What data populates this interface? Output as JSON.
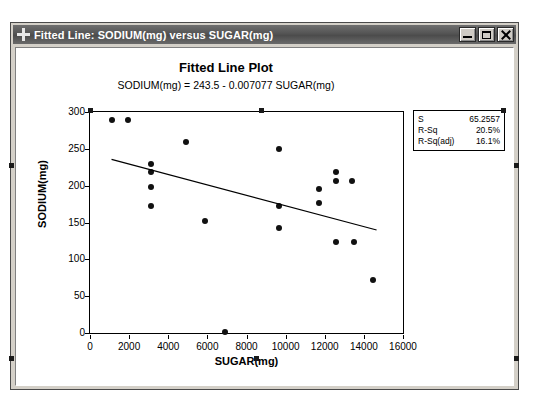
{
  "window": {
    "title": "Fitted Line: SODIUM(mg) versus SUGAR(mg)",
    "icon": "crosshair-icon",
    "buttons": {
      "minimize": "Minimize",
      "maximize": "Maximize",
      "close": "Close"
    }
  },
  "stats": {
    "rows": [
      {
        "key": "S",
        "value": "65.2557"
      },
      {
        "key": "R-Sq",
        "value": "20.5%"
      },
      {
        "key": "R-Sq(adj)",
        "value": "16.1%"
      }
    ]
  },
  "chart_data": {
    "type": "scatter",
    "title": "Fitted Line Plot",
    "subtitle": "SODIUM(mg) =  243.5 - 0.007077 SUGAR(mg)",
    "xlabel": "SUGAR(mg)",
    "ylabel": "SODIUM(mg)",
    "xlim": [
      0,
      16000
    ],
    "ylim": [
      0,
      300
    ],
    "xticks": [
      0,
      2000,
      4000,
      6000,
      8000,
      10000,
      12000,
      14000,
      16000
    ],
    "xtick_labels": [
      "0",
      "2000",
      "4000",
      "6000",
      "8000",
      "10000",
      "12000",
      "14000",
      "16000"
    ],
    "yticks": [
      0,
      50,
      100,
      150,
      200,
      250,
      300
    ],
    "ytick_labels": [
      "0",
      "50",
      "100",
      "150",
      "200",
      "250",
      "300"
    ],
    "grid": false,
    "legend": false,
    "marker_color": "#111111",
    "line_color": "#000000",
    "points": [
      {
        "x": 1100,
        "y": 289
      },
      {
        "x": 1950,
        "y": 289
      },
      {
        "x": 3100,
        "y": 230
      },
      {
        "x": 3100,
        "y": 218
      },
      {
        "x": 3100,
        "y": 198
      },
      {
        "x": 3100,
        "y": 172
      },
      {
        "x": 4900,
        "y": 259
      },
      {
        "x": 5900,
        "y": 152
      },
      {
        "x": 6900,
        "y": 1
      },
      {
        "x": 9650,
        "y": 250
      },
      {
        "x": 9650,
        "y": 172
      },
      {
        "x": 9650,
        "y": 143
      },
      {
        "x": 11700,
        "y": 195
      },
      {
        "x": 11700,
        "y": 176
      },
      {
        "x": 12550,
        "y": 219
      },
      {
        "x": 12550,
        "y": 207
      },
      {
        "x": 12550,
        "y": 124
      },
      {
        "x": 13400,
        "y": 207
      },
      {
        "x": 13500,
        "y": 124
      },
      {
        "x": 14450,
        "y": 72
      }
    ],
    "fit_line": {
      "intercept": 243.5,
      "slope": -0.007077,
      "x_start": 1100,
      "x_end": 14650,
      "y_start": 235.7,
      "y_end": 139.8
    },
    "annotations": [
      {
        "label": "S",
        "value": "65.2557"
      },
      {
        "label": "R-Sq",
        "value": "20.5%"
      },
      {
        "label": "R-Sq(adj)",
        "value": "16.1%"
      }
    ]
  }
}
